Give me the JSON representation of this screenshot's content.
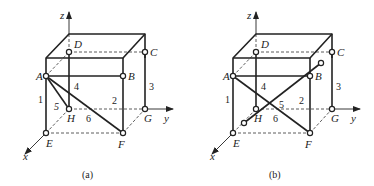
{
  "figure": {
    "panels": [
      {
        "id": "a",
        "caption": "(a)",
        "offset_x": 0,
        "axes": {
          "x": "x",
          "y": "y",
          "z": "z"
        },
        "nodes": {
          "A": "A",
          "B": "B",
          "C": "C",
          "D": "D",
          "E": "E",
          "F": "F",
          "G": "G",
          "H": "H"
        },
        "members": {
          "1": "1",
          "2": "2",
          "3": "3",
          "4": "4",
          "5": "5",
          "6": "6"
        },
        "member_connections": [
          {
            "label": "1",
            "from": "A",
            "to": "E"
          },
          {
            "label": "2",
            "from": "B",
            "to": "F"
          },
          {
            "label": "3",
            "from": "C",
            "to": "G"
          },
          {
            "label": "4",
            "from": "D",
            "to": "H"
          },
          {
            "label": "5",
            "from": "A",
            "to": "H"
          },
          {
            "label": "6",
            "from": "A",
            "to": "F"
          }
        ]
      },
      {
        "id": "b",
        "caption": "(b)",
        "offset_x": 187,
        "axes": {
          "x": "x",
          "y": "y",
          "z": "z"
        },
        "nodes": {
          "A": "A",
          "B": "B",
          "C": "C",
          "D": "D",
          "E": "E",
          "F": "F",
          "G": "G",
          "H": "H"
        },
        "members": {
          "1": "1",
          "2": "2",
          "3": "3",
          "4": "4",
          "5": "5",
          "6": "6"
        },
        "member_connections": [
          {
            "label": "1",
            "from": "A",
            "to": "E"
          },
          {
            "label": "2",
            "from": "B",
            "to": "F"
          },
          {
            "label": "3",
            "from": "C",
            "to": "G"
          },
          {
            "label": "4",
            "from": "D",
            "to": "H"
          },
          {
            "label": "5",
            "from": "A",
            "to": "F"
          },
          {
            "label": "6",
            "from": "free-support (near E/H)",
            "to": "free-support (near B/C)"
          }
        ]
      }
    ],
    "colors": {
      "line": "#222222",
      "background": "#ffffff"
    }
  }
}
